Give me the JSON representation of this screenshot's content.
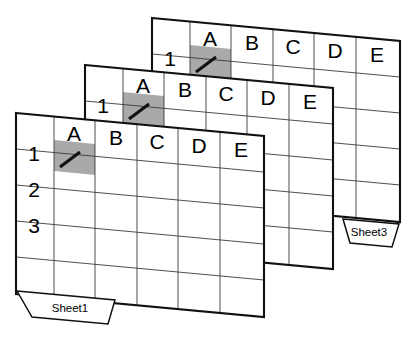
{
  "figure": {
    "sheet_count": 3,
    "colors": {
      "background": "#ffffff",
      "grid_line": "#3b3b3b",
      "outline": "#111111",
      "selected_cell_fill": "#a9a9a9",
      "text": "#000000"
    }
  },
  "columns": [
    "A",
    "B",
    "C",
    "D",
    "E"
  ],
  "rows": [
    "1",
    "2",
    "3"
  ],
  "selected_cell": {
    "column": "A",
    "row": "1",
    "mark": "diagonal-slash"
  },
  "sheets": [
    {
      "id": "sheet3",
      "depth": "back",
      "tab_label": "Sheet3",
      "tab_visible": true,
      "origin_x": 152,
      "origin_y": 18,
      "columns": [
        "A",
        "B",
        "C",
        "D",
        "E"
      ],
      "rows": [
        "1",
        "2",
        "3"
      ],
      "row_labels_visible": [
        "1"
      ],
      "selected_cell": "A1"
    },
    {
      "id": "sheet2",
      "depth": "middle",
      "tab_label": "Sheet2",
      "tab_visible": false,
      "origin_x": 85,
      "origin_y": 65,
      "columns": [
        "A",
        "B",
        "C",
        "D",
        "E"
      ],
      "rows": [
        "1",
        "2",
        "3"
      ],
      "row_labels_visible": [
        "1"
      ],
      "selected_cell": "A1"
    },
    {
      "id": "sheet1",
      "depth": "front",
      "tab_label": "Sheet1",
      "tab_visible": true,
      "origin_x": 16,
      "origin_y": 113,
      "columns": [
        "A",
        "B",
        "C",
        "D",
        "E"
      ],
      "rows": [
        "1",
        "2",
        "3"
      ],
      "row_labels_visible": [
        "1",
        "2",
        "3"
      ],
      "selected_cell": "A1"
    }
  ],
  "labels": {
    "col_a": "A",
    "col_b": "B",
    "col_c": "C",
    "col_d": "D",
    "col_e": "E",
    "row_1": "1",
    "row_2": "2",
    "row_3": "3",
    "sheet1_tab": "Sheet1",
    "sheet3_tab": "Sheet3"
  }
}
